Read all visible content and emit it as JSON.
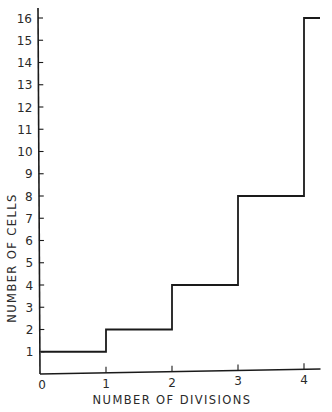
{
  "chart_data": {
    "type": "line",
    "style": "step",
    "title": "",
    "xlabel": "NUMBER OF DIVISIONS",
    "ylabel": "NUMBER OF CELLS",
    "x_ticks": [
      "0",
      "1",
      "2",
      "3",
      "4"
    ],
    "y_ticks": [
      "1",
      "2",
      "3",
      "4",
      "5",
      "6",
      "7",
      "8",
      "9",
      "10",
      "11",
      "12",
      "13",
      "14",
      "15",
      "16"
    ],
    "xlim": [
      0,
      4.25
    ],
    "ylim": [
      0,
      16.5
    ],
    "grid": false,
    "legend": null,
    "series": [
      {
        "name": "cells",
        "x": [
          0,
          1,
          2,
          3,
          4
        ],
        "values": [
          1,
          2,
          4,
          8,
          16
        ]
      }
    ]
  }
}
